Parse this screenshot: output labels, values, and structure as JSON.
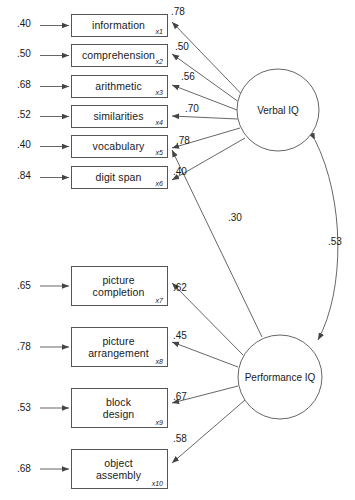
{
  "diagram": {
    "type": "structural-equation-model",
    "title": "",
    "factors": [
      {
        "id": "verbal",
        "label": "Verbal IQ",
        "cx": 278,
        "cy": 110,
        "r": 41
      },
      {
        "id": "performance",
        "label": "Performance IQ",
        "cx": 280,
        "cy": 377,
        "r": 42
      }
    ],
    "indicators": [
      {
        "code": "x1",
        "line1": "information",
        "line2": "",
        "error": ".40",
        "loading": ".78",
        "factor": "verbal",
        "x": 71,
        "y": 14,
        "w": 97,
        "h": 23
      },
      {
        "code": "x2",
        "line1": "comprehension",
        "line2": "",
        "error": ".50",
        "loading": ".50",
        "factor": "verbal",
        "x": 71,
        "y": 44,
        "w": 97,
        "h": 23
      },
      {
        "code": "x3",
        "line1": "arithmetic",
        "line2": "",
        "error": ".68",
        "loading": ".56",
        "factor": "verbal",
        "x": 71,
        "y": 75,
        "w": 97,
        "h": 23
      },
      {
        "code": "x4",
        "line1": "similarities",
        "line2": "",
        "error": ".52",
        "loading": ".70",
        "factor": "verbal",
        "x": 71,
        "y": 105,
        "w": 97,
        "h": 23
      },
      {
        "code": "x5",
        "line1": "vocabulary",
        "line2": "",
        "error": ".40",
        "loading": ".78",
        "factor": "verbal",
        "x": 71,
        "y": 135,
        "w": 97,
        "h": 23
      },
      {
        "code": "x6",
        "line1": "digit span",
        "line2": "",
        "error": ".84",
        "loading": ".40",
        "factor": "verbal",
        "x": 71,
        "y": 166,
        "w": 97,
        "h": 23
      },
      {
        "code": "x7",
        "line1": "picture",
        "line2": "completion",
        "error": ".65",
        "loading": ".62",
        "factor": "performance",
        "x": 71,
        "y": 266,
        "w": 97,
        "h": 40
      },
      {
        "code": "x8",
        "line1": "picture",
        "line2": "arrangement",
        "error": ".78",
        "loading": ".45",
        "factor": "performance",
        "x": 71,
        "y": 327,
        "w": 97,
        "h": 40
      },
      {
        "code": "x9",
        "line1": "block",
        "line2": "design",
        "error": ".53",
        "loading": ".67",
        "factor": "performance",
        "x": 71,
        "y": 388,
        "w": 97,
        "h": 40
      },
      {
        "code": "x10",
        "line1": "object",
        "line2": "assembly",
        "error": ".68",
        "loading": ".58",
        "factor": "performance",
        "x": 71,
        "y": 449,
        "w": 97,
        "h": 40
      }
    ],
    "cross_loading": {
      "from": "performance",
      "to": "x5",
      "value": ".30"
    },
    "factor_correlation": {
      "between": [
        "verbal",
        "performance"
      ],
      "value": ".53"
    },
    "loading_label_positions": [
      {
        "code": "x1",
        "value": ".78",
        "x": 171,
        "y": 6
      },
      {
        "code": "x2",
        "value": ".50",
        "x": 175,
        "y": 41
      },
      {
        "code": "x3",
        "value": ".56",
        "x": 181,
        "y": 71
      },
      {
        "code": "x4",
        "value": ".70",
        "x": 185,
        "y": 103
      },
      {
        "code": "x5",
        "value": ".78",
        "x": 176,
        "y": 135
      },
      {
        "code": "x6",
        "value": ".40",
        "x": 173,
        "y": 166
      },
      {
        "code": "x7",
        "value": ".62",
        "x": 173,
        "y": 282
      },
      {
        "code": "x8",
        "value": ".45",
        "x": 173,
        "y": 330
      },
      {
        "code": "x9",
        "value": ".67",
        "x": 173,
        "y": 391
      },
      {
        "code": "x10",
        "value": ".58",
        "x": 173,
        "y": 433
      }
    ],
    "error_label_positions": [
      {
        "code": "x1",
        "value": ".40",
        "x": 17,
        "y": 18
      },
      {
        "code": "x2",
        "value": ".50",
        "x": 17,
        "y": 48
      },
      {
        "code": "x3",
        "value": ".68",
        "x": 17,
        "y": 79
      },
      {
        "code": "x4",
        "value": ".52",
        "x": 17,
        "y": 109
      },
      {
        "code": "x5",
        "value": ".40",
        "x": 17,
        "y": 139
      },
      {
        "code": "x6",
        "value": ".84",
        "x": 17,
        "y": 170
      },
      {
        "code": "x7",
        "value": ".65",
        "x": 17,
        "y": 280
      },
      {
        "code": "x8",
        "value": ".78",
        "x": 17,
        "y": 341
      },
      {
        "code": "x9",
        "value": ".53",
        "x": 17,
        "y": 402
      },
      {
        "code": "x10",
        "value": ".68",
        "x": 17,
        "y": 463
      }
    ],
    "cross_loading_label": {
      "value": ".30",
      "x": 228,
      "y": 212
    },
    "correlation_label": {
      "value": ".53",
      "x": 328,
      "y": 236
    },
    "colors": {
      "stroke": "#555555",
      "text": "#1a1a1a",
      "background": "#ffffff"
    }
  }
}
